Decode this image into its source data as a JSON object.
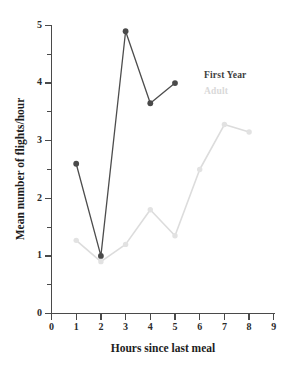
{
  "chart_data": {
    "type": "line",
    "title": "",
    "xlabel": "Hours since last meal",
    "ylabel": "Mean number of flights/hour",
    "xlim": [
      0,
      9
    ],
    "ylim": [
      0,
      5
    ],
    "x_ticks": [
      "0",
      "1",
      "2",
      "3",
      "4",
      "5",
      "6",
      "7",
      "8",
      "9"
    ],
    "y_ticks": [
      "0",
      "1",
      "2",
      "3",
      "4",
      "5"
    ],
    "y_minor_ticks": [
      0.5,
      1.5,
      2.5,
      3.5,
      4.5
    ],
    "grid": false,
    "legend_position": "upper right inside",
    "series": [
      {
        "name": "First Year",
        "color": "#4a4a4a",
        "x": [
          1,
          2,
          3,
          4,
          5
        ],
        "values": [
          2.6,
          1.0,
          4.9,
          3.65,
          4.0
        ]
      },
      {
        "name": "Adult",
        "color": "#dcdcdc",
        "x": [
          1,
          2,
          3,
          4,
          5,
          6,
          7,
          8
        ],
        "values": [
          1.27,
          0.9,
          1.2,
          1.8,
          1.35,
          2.5,
          3.28,
          3.15
        ]
      }
    ]
  },
  "legend": {
    "entries": [
      {
        "label": "First Year"
      },
      {
        "label": "Adult"
      }
    ]
  },
  "axes": {
    "x_title": "Hours since last meal",
    "y_title": "Mean number of flights/hour"
  },
  "colors": {
    "first_year": "#4a4a4a",
    "adult": "#dcdcdc",
    "axis": "#4a4a4a",
    "text": "#1d1d1d",
    "background": "#ffffff"
  }
}
